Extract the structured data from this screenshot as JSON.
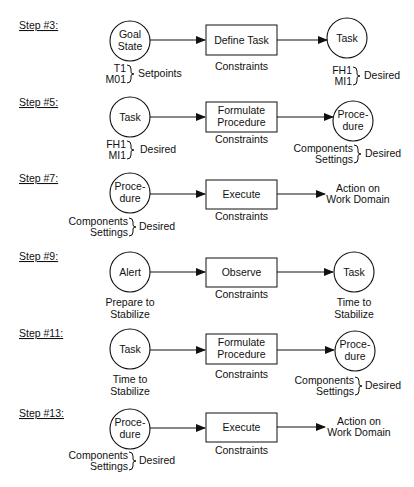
{
  "diagram": {
    "type": "flow-steps",
    "steps": [
      {
        "label": "Step #3:",
        "source": {
          "shape": "circle",
          "lines": [
            "Goal",
            "State"
          ],
          "annotation": {
            "items": [
              "T1",
              "M01"
            ],
            "brace_label": "Setpoints"
          }
        },
        "process": {
          "lines": [
            "Define Task"
          ],
          "caption": "Constraints"
        },
        "target": {
          "shape": "circle",
          "lines": [
            "Task"
          ],
          "annotation": {
            "items": [
              "FH1",
              "MI1"
            ],
            "brace_label": "Desired"
          }
        }
      },
      {
        "label": "Step #5:",
        "source": {
          "shape": "circle",
          "lines": [
            "Task"
          ],
          "annotation": {
            "items": [
              "FH1",
              "MI1"
            ],
            "brace_label": "Desired"
          }
        },
        "process": {
          "lines": [
            "Formulate",
            "Procedure"
          ],
          "caption": "Constraints"
        },
        "target": {
          "shape": "circle",
          "lines": [
            "Proce-",
            "dure"
          ],
          "annotation": {
            "items": [
              "Components",
              "Settings"
            ],
            "brace_label": "Desired"
          }
        }
      },
      {
        "label": "Step #7:",
        "source": {
          "shape": "circle",
          "lines": [
            "Proce-",
            "dure"
          ],
          "annotation": {
            "items": [
              "Components",
              "Settings"
            ],
            "brace_label": "Desired"
          }
        },
        "process": {
          "lines": [
            "Execute"
          ],
          "caption": "Constraints"
        },
        "target": {
          "shape": "text",
          "lines": [
            "Action on",
            "Work Domain"
          ]
        }
      },
      {
        "label": "Step #9:",
        "source": {
          "shape": "circle",
          "lines": [
            "Alert"
          ],
          "caption": [
            "Prepare to",
            "Stabilize"
          ]
        },
        "process": {
          "lines": [
            "Observe"
          ],
          "caption": "Constraints"
        },
        "target": {
          "shape": "circle",
          "lines": [
            "Task"
          ],
          "caption": [
            "Time to",
            "Stabilize"
          ]
        }
      },
      {
        "label": "Step #11:",
        "source": {
          "shape": "circle",
          "lines": [
            "Task"
          ],
          "caption": [
            "Time to",
            "Stabilize"
          ]
        },
        "process": {
          "lines": [
            "Formulate",
            "Procedure"
          ],
          "caption": "Constraints"
        },
        "target": {
          "shape": "circle",
          "lines": [
            "Proce-",
            "dure"
          ],
          "annotation": {
            "items": [
              "Components",
              "Settings"
            ],
            "brace_label": "Desired"
          }
        }
      },
      {
        "label": "Step #13:",
        "source": {
          "shape": "circle",
          "lines": [
            "Proce-",
            "dure"
          ],
          "annotation": {
            "items": [
              "Components",
              "Settings"
            ],
            "brace_label": "Desired"
          }
        },
        "process": {
          "lines": [
            "Execute"
          ],
          "caption": "Constraints"
        },
        "target": {
          "shape": "text",
          "lines": [
            "Action on",
            "Work Domain"
          ]
        }
      }
    ]
  }
}
